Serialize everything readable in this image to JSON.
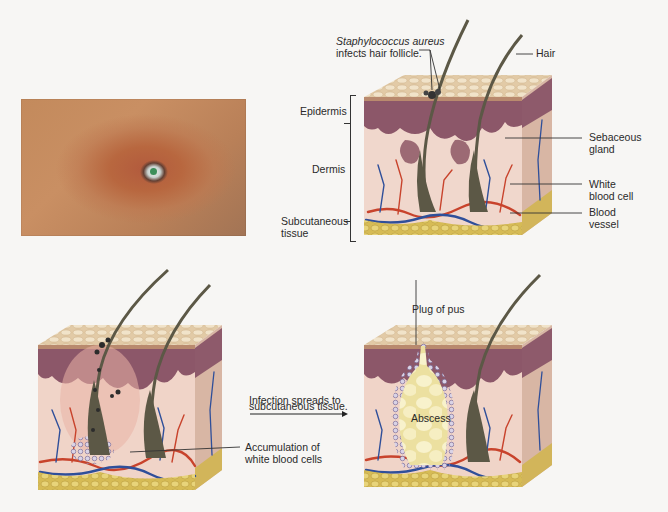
{
  "figure": {
    "photo": {
      "description": "Photograph of skin lesion (boil) with reddened surrounding area"
    },
    "panel_top_right": {
      "layer_labels": {
        "epidermis": "Epidermis",
        "dermis": "Dermis",
        "subcutaneous_line1": "Subcutaneous",
        "subcutaneous_line2": "tissue"
      },
      "callout_staph_line1": "Staphylococcus aureus",
      "callout_staph_line2": "infects hair follicle.",
      "callout_hair": "Hair",
      "callout_sebaceous_line1": "Sebaceous",
      "callout_sebaceous_line2": "gland",
      "callout_wbc_line1": "White",
      "callout_wbc_line2": "blood cell",
      "callout_vessel_line1": "Blood",
      "callout_vessel_line2": "vessel"
    },
    "panel_bottom_left": {
      "callout_accum_line1": "Accumulation of",
      "callout_accum_line2": "white blood cells"
    },
    "transition": {
      "line1": "Infection spreads to",
      "line2": "subcutaneous tissue."
    },
    "panel_bottom_right": {
      "callout_plug": "Plug of pus",
      "callout_abscess": "Abscess"
    }
  },
  "colors": {
    "epidermis_top": "#e6d2b2",
    "epidermis_layer": "#8f5a6c",
    "dermis": "#f0d6cc",
    "subcutaneous_fat": "#d9c05a",
    "artery": "#c8432c",
    "vein": "#2f4f9a",
    "hair": "#5c5846",
    "pus": "#f2e9a8",
    "side_face": "#d4b0a0"
  }
}
